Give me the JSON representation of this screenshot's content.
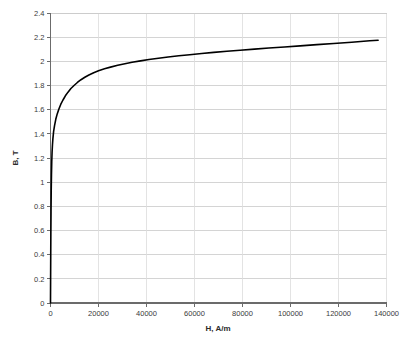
{
  "chart_data": {
    "type": "line",
    "title": "",
    "xlabel": "H, A/m",
    "ylabel": "B, T",
    "xlim": [
      0,
      140000
    ],
    "ylim": [
      0,
      2.4
    ],
    "xticks": [
      0,
      20000,
      40000,
      60000,
      80000,
      100000,
      120000,
      140000
    ],
    "xtick_labels": [
      "0",
      "20000",
      "40000",
      "60000",
      "80000",
      "100000",
      "120000",
      "140000"
    ],
    "yticks": [
      0,
      0.2,
      0.4,
      0.6,
      0.8,
      1,
      1.2,
      1.4,
      1.6,
      1.8,
      2,
      2.2,
      2.4
    ],
    "ytick_labels": [
      "0",
      "0.2",
      "0.4",
      "0.6",
      "0.8",
      "1",
      "1.2",
      "1.4",
      "1.6",
      "1.8",
      "2",
      "2.2",
      "2.4"
    ],
    "grid": {
      "horizontal": true,
      "vertical": true,
      "color": "#c9c9c9"
    },
    "legend": null,
    "series": [
      {
        "name": "B-H curve",
        "color": "#000000",
        "line_width": 1.6,
        "x": [
          0,
          40,
          90,
          150,
          220,
          300,
          400,
          520,
          660,
          820,
          1000,
          1300,
          1700,
          2200,
          2800,
          3500,
          4300,
          5200,
          6200,
          7300,
          8500,
          9800,
          11200,
          12700,
          14300,
          16000,
          18000,
          20000,
          22500,
          25000,
          28000,
          31000,
          34000,
          37500,
          41000,
          45000,
          49000,
          53500,
          58000,
          63000,
          68000,
          73500,
          79000,
          85000,
          91000,
          97500,
          104000,
          111000,
          118000,
          125500,
          133000,
          136500
        ],
        "y": [
          0.0,
          0.18,
          0.38,
          0.58,
          0.76,
          0.93,
          1.06,
          1.17,
          1.25,
          1.31,
          1.36,
          1.42,
          1.47,
          1.52,
          1.565,
          1.605,
          1.645,
          1.68,
          1.715,
          1.745,
          1.775,
          1.8,
          1.825,
          1.848,
          1.868,
          1.887,
          1.906,
          1.922,
          1.938,
          1.952,
          1.967,
          1.98,
          1.992,
          2.004,
          2.015,
          2.026,
          2.036,
          2.046,
          2.055,
          2.065,
          2.074,
          2.083,
          2.092,
          2.101,
          2.11,
          2.119,
          2.128,
          2.138,
          2.148,
          2.158,
          2.17,
          2.175
        ]
      }
    ]
  },
  "axes": {
    "x_title": "H, A/m",
    "y_title": "B, T"
  }
}
